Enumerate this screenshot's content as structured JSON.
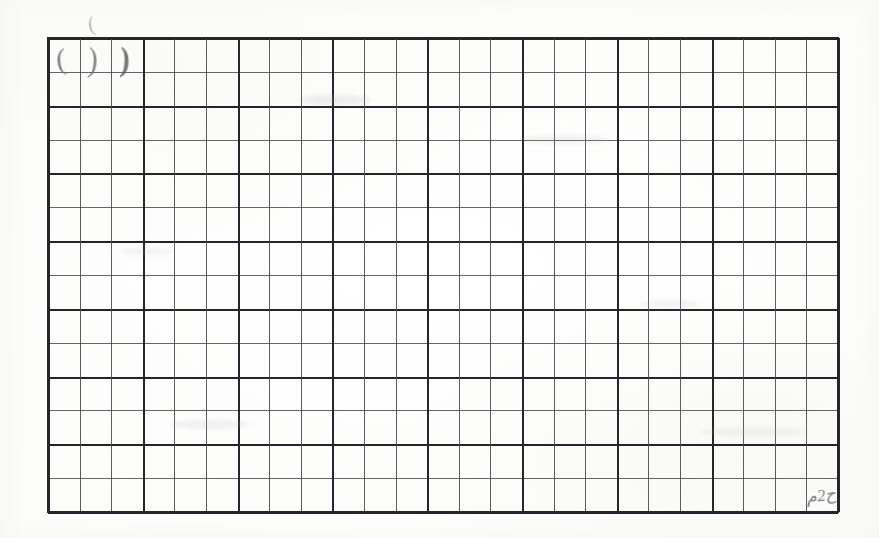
{
  "document": {
    "type": "scanned-grid-worksheet",
    "medium": "photograph of ruled graph paper",
    "background_color": "#fefefe",
    "ink_color": "#26262b",
    "pencil_color": "#6e6e72"
  },
  "grid": {
    "columns": 25,
    "rows": 14,
    "left": 48,
    "top": 38,
    "width": 790,
    "height": 474,
    "cell_width": 31.6,
    "cell_height": 33.9,
    "frame_color": "#26262b",
    "thin_line_color": "#55555a",
    "bold_line_color": "#24242a",
    "bold_row_lines": [
      0,
      2,
      4,
      6,
      8,
      10,
      12,
      14
    ],
    "bold_column_lines": [
      0,
      3,
      6,
      9,
      12,
      15,
      18,
      21,
      25
    ]
  },
  "annotations": {
    "items": [
      {
        "name": "pencil-mark-cell-1",
        "glyph": "(",
        "row": 1,
        "column": 1,
        "x": 56,
        "y": 44,
        "description": "faint vertical pencil stroke in first cell"
      },
      {
        "name": "pencil-mark-cell-2",
        "glyph": ")",
        "row": 1,
        "column": 2,
        "x": 88,
        "y": 44,
        "description": "faint curved pencil stroke in second cell"
      },
      {
        "name": "pencil-mark-cell-3",
        "glyph": ")",
        "row": 1,
        "column": 3,
        "x": 120,
        "y": 44,
        "description": "darker short pencil stroke in third cell"
      },
      {
        "name": "pencil-mark-above-grid",
        "glyph": "(",
        "row": 0,
        "column": 3,
        "x": 88,
        "y": 14,
        "description": "stray faint pencil tick above the grid top edge"
      },
      {
        "name": "pencil-scribble-bottom-right",
        "glyph": "ح2م",
        "row": 14,
        "column": 25,
        "x": 806,
        "y": 487,
        "description": "small illegible pencil scribble in the last bottom-right cell"
      }
    ]
  },
  "smudges": [
    {
      "x": 300,
      "y": 95,
      "w": 70,
      "h": 10,
      "color": "rgba(170,170,175,0.18)"
    },
    {
      "x": 520,
      "y": 135,
      "w": 90,
      "h": 9,
      "color": "rgba(175,175,180,0.15)"
    },
    {
      "x": 640,
      "y": 300,
      "w": 60,
      "h": 8,
      "color": "rgba(170,170,175,0.14)"
    },
    {
      "x": 170,
      "y": 420,
      "w": 80,
      "h": 9,
      "color": "rgba(172,172,178,0.16)"
    },
    {
      "x": 700,
      "y": 428,
      "w": 110,
      "h": 8,
      "color": "rgba(176,176,180,0.14)"
    },
    {
      "x": 120,
      "y": 248,
      "w": 55,
      "h": 7,
      "color": "rgba(178,178,182,0.13)"
    }
  ]
}
